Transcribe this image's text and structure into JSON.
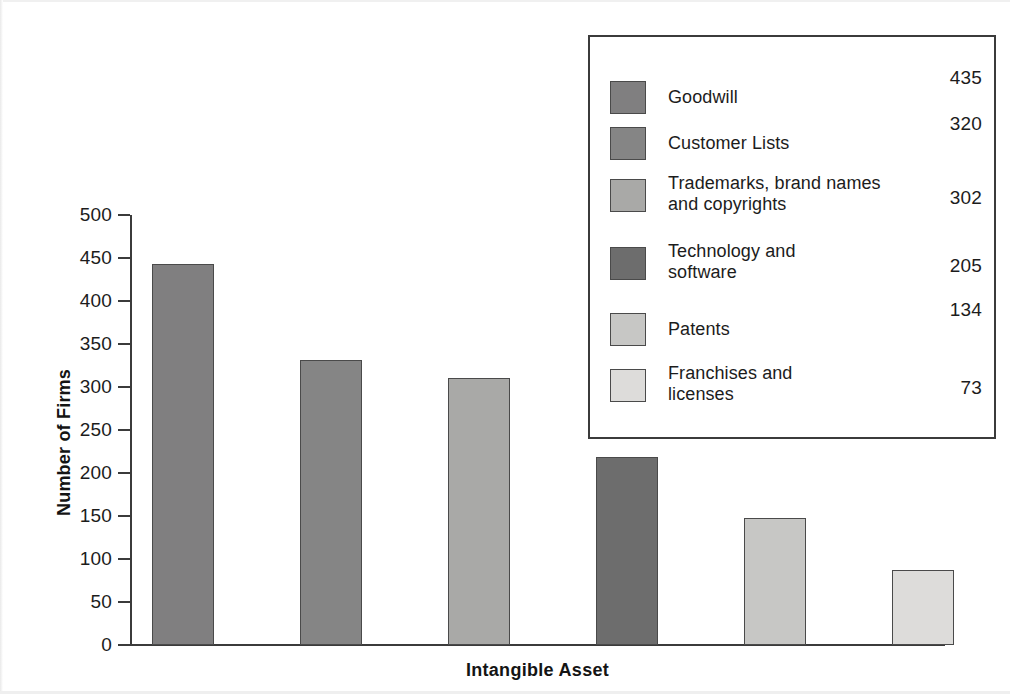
{
  "chart_data": {
    "type": "bar",
    "title": "",
    "xlabel": "Intangible Asset",
    "ylabel": "Number of Firms",
    "categories": [
      "Goodwill",
      "Customer Lists",
      "Trademarks, brand names and copyrights",
      "Technology and software",
      "Patents",
      "Franchises and licenses"
    ],
    "values": [
      435,
      320,
      302,
      205,
      134,
      73
    ],
    "bar_pixel_values": [
      443,
      331,
      311,
      219,
      148,
      87
    ],
    "ylim": [
      0,
      500
    ],
    "ytick_labels": [
      "500",
      "450",
      "400",
      "350",
      "300",
      "250",
      "200",
      "150",
      "100",
      "50",
      "0"
    ],
    "ytick_values": [
      500,
      450,
      400,
      350,
      300,
      250,
      200,
      150,
      100,
      50,
      0
    ],
    "grid": false,
    "legend_position": "upper-right-inset",
    "colors": [
      "#807f80",
      "#858585",
      "#a9a9a7",
      "#6d6d6d",
      "#c7c7c5",
      "#dddcda"
    ]
  },
  "legend": {
    "entries": [
      {
        "label_line1": "Goodwill",
        "label_line2": "",
        "value": "435",
        "color": "#807f80"
      },
      {
        "label_line1": "Customer Lists",
        "label_line2": "",
        "value": "320",
        "color": "#858585"
      },
      {
        "label_line1": "Trademarks, brand names",
        "label_line2": "and copyrights",
        "value": "302",
        "color": "#a9a9a7"
      },
      {
        "label_line1": "Technology and",
        "label_line2": "software",
        "value": "205",
        "color": "#6d6d6d"
      },
      {
        "label_line1": "Patents",
        "label_line2": "",
        "value": "134",
        "color": "#c7c7c5"
      },
      {
        "label_line1": "Franchises and",
        "label_line2": "licenses",
        "value": "73",
        "color": "#dddcda"
      }
    ]
  },
  "axes": {
    "y_title": "Number of Firms",
    "x_title": "Intangible Asset"
  }
}
